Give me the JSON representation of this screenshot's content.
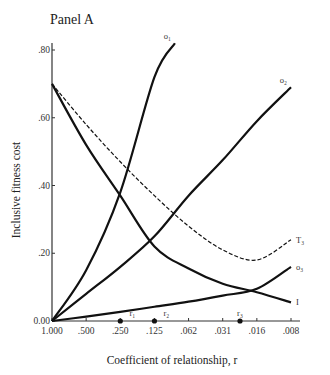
{
  "panel_title": "Panel A",
  "chart_data": {
    "type": "line",
    "title": "Panel A",
    "xlabel": "Coefficient of relationship, r",
    "ylabel": "Inclusive fitness cost",
    "x_tick_labels": [
      "1.000",
      ".500",
      ".250",
      ".125",
      ".062",
      ".031",
      ".016",
      ".008"
    ],
    "x": [
      1.0,
      0.5,
      0.25,
      0.125,
      0.062,
      0.031,
      0.016,
      0.008
    ],
    "x_scale": "log2 (reversed)",
    "y_tick_labels": [
      "0.00",
      ".20",
      ".40",
      ".60",
      ".80"
    ],
    "ylim": [
      0,
      0.82
    ],
    "grid": false,
    "series": [
      {
        "name": "o1",
        "label": "o₁",
        "style": "solid",
        "values": [
          0.0,
          0.15,
          0.38,
          0.72,
          null,
          null,
          null,
          null
        ],
        "end": {
          "x_index": 3.6,
          "y": 0.82
        }
      },
      {
        "name": "o2",
        "label": "o₂",
        "style": "solid",
        "values": [
          0.0,
          0.08,
          0.16,
          0.25,
          0.37,
          0.475,
          0.59,
          0.69
        ]
      },
      {
        "name": "o3",
        "label": "o₃",
        "style": "solid",
        "values": [
          0.0,
          0.013,
          0.027,
          0.042,
          0.057,
          0.075,
          0.095,
          0.16
        ]
      },
      {
        "name": "I",
        "label": "I",
        "style": "solid",
        "values": [
          0.7,
          0.52,
          0.37,
          0.22,
          0.155,
          0.11,
          0.085,
          0.055
        ]
      },
      {
        "name": "T3",
        "label": "T₃",
        "style": "dashed",
        "values": [
          0.7,
          0.58,
          0.47,
          0.37,
          0.28,
          0.21,
          0.18,
          0.24
        ]
      }
    ],
    "markers": [
      {
        "label": "r₁",
        "x": 0.25
      },
      {
        "label": "r₂",
        "x": 0.125
      },
      {
        "label": "r₃",
        "x": 0.022
      }
    ]
  }
}
